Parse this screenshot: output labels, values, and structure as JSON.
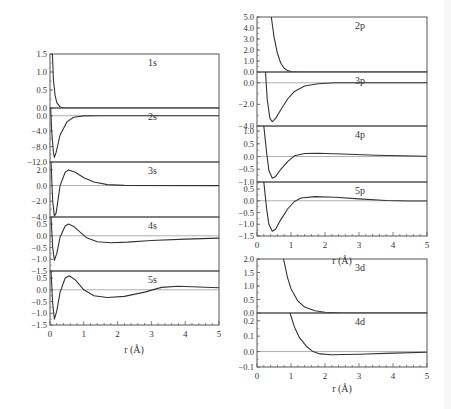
{
  "chart_data": [
    {
      "type": "line",
      "title": "Left stack: s radial functions",
      "xlabel": "r (Å)",
      "xlim": [
        0,
        5
      ],
      "xticks": [
        "0",
        "1",
        "2",
        "3",
        "4",
        "5"
      ],
      "frame": {
        "x0": 50,
        "x1": 219
      },
      "panels": [
        {
          "label": "1s",
          "y0": 54,
          "y1": 108,
          "ylim": [
            0.0,
            1.5
          ],
          "yticks": [
            "1.5",
            "1.0",
            "0.5",
            "0.0"
          ],
          "zero_line": false,
          "curve": [
            [
              0.07,
              1.5
            ],
            [
              0.1,
              0.8
            ],
            [
              0.15,
              0.35
            ],
            [
              0.2,
              0.15
            ],
            [
              0.3,
              0.03
            ],
            [
              0.4,
              0.0
            ],
            [
              5,
              0.0
            ]
          ]
        },
        {
          "label": "2s",
          "y0": 108,
          "y1": 162,
          "ylim": [
            -12.0,
            2.0
          ],
          "yticks": [
            "0.0",
            "-4.0",
            "-8.0",
            "-12.0"
          ],
          "zero_line": true,
          "curve": [
            [
              0.02,
              2.0
            ],
            [
              0.05,
              -4
            ],
            [
              0.1,
              -9.5
            ],
            [
              0.13,
              -10.8
            ],
            [
              0.18,
              -9.5
            ],
            [
              0.3,
              -5
            ],
            [
              0.5,
              -1.6
            ],
            [
              0.7,
              -0.4
            ],
            [
              1.0,
              -0.05
            ],
            [
              1.5,
              0
            ],
            [
              5,
              0
            ]
          ]
        },
        {
          "label": "3s",
          "y0": 162,
          "y1": 217,
          "ylim": [
            -4.0,
            3.0
          ],
          "yticks": [
            "2.0",
            "0.0",
            "-2.0",
            "-4.0"
          ],
          "zero_line": true,
          "curve": [
            [
              0.03,
              3.0
            ],
            [
              0.08,
              -2
            ],
            [
              0.13,
              -3.9
            ],
            [
              0.18,
              -3.5
            ],
            [
              0.3,
              0
            ],
            [
              0.45,
              1.7
            ],
            [
              0.55,
              2.0
            ],
            [
              0.75,
              1.7
            ],
            [
              1.0,
              1.0
            ],
            [
              1.3,
              0.45
            ],
            [
              1.7,
              0.12
            ],
            [
              2.2,
              0.02
            ],
            [
              5,
              0
            ]
          ]
        },
        {
          "label": "4s",
          "y0": 217,
          "y1": 271,
          "ylim": [
            -1.5,
            0.8
          ],
          "yticks": [
            "0.5",
            "0.0",
            "-0.5",
            "-1.0",
            "-1.5"
          ],
          "zero_line": true,
          "curve": [
            [
              0.03,
              0.8
            ],
            [
              0.08,
              -0.5
            ],
            [
              0.13,
              -1.05
            ],
            [
              0.2,
              -0.75
            ],
            [
              0.3,
              -0.05
            ],
            [
              0.45,
              0.42
            ],
            [
              0.55,
              0.5
            ],
            [
              0.7,
              0.4
            ],
            [
              0.9,
              0.15
            ],
            [
              1.1,
              -0.1
            ],
            [
              1.4,
              -0.25
            ],
            [
              1.8,
              -0.3
            ],
            [
              2.3,
              -0.27
            ],
            [
              3.0,
              -0.2
            ],
            [
              4.0,
              -0.14
            ],
            [
              5.0,
              -0.1
            ]
          ]
        },
        {
          "label": "5s",
          "y0": 271,
          "y1": 325,
          "ylim": [
            -1.5,
            0.8
          ],
          "yticks": [
            "0.5",
            "0.0",
            "-0.5",
            "-1.0",
            "-1.5"
          ],
          "zero_line": true,
          "curve": [
            [
              0.03,
              0.8
            ],
            [
              0.08,
              -0.6
            ],
            [
              0.13,
              -1.25
            ],
            [
              0.2,
              -0.9
            ],
            [
              0.3,
              -0.1
            ],
            [
              0.45,
              0.5
            ],
            [
              0.57,
              0.6
            ],
            [
              0.75,
              0.42
            ],
            [
              1.0,
              0.0
            ],
            [
              1.3,
              -0.25
            ],
            [
              1.7,
              -0.33
            ],
            [
              2.2,
              -0.28
            ],
            [
              2.8,
              -0.1
            ],
            [
              3.3,
              0.1
            ],
            [
              3.8,
              0.15
            ],
            [
              4.4,
              0.12
            ],
            [
              5.0,
              0.09
            ]
          ]
        }
      ]
    },
    {
      "type": "line",
      "title": "Right stacks: p and d radial functions",
      "xlabel": "r (Å)",
      "xlim": [
        0,
        5
      ],
      "xticks": [
        "0",
        "1",
        "2",
        "3",
        "4",
        "5"
      ],
      "frame": {
        "x0": 257,
        "x1": 427
      },
      "groups": [
        {
          "panels": [
            {
              "label": "2p",
              "y0": 17,
              "y1": 72,
              "ylim": [
                0.0,
                5.0
              ],
              "yticks": [
                "5.0",
                "4.0",
                "3.0",
                "2.0",
                "1.0",
                "0.0"
              ],
              "zero_line": false,
              "curve": [
                [
                  0.42,
                  5.0
                ],
                [
                  0.5,
                  3.2
                ],
                [
                  0.6,
                  1.7
                ],
                [
                  0.7,
                  0.8
                ],
                [
                  0.8,
                  0.35
                ],
                [
                  0.9,
                  0.13
                ],
                [
                  1.0,
                  0.04
                ],
                [
                  1.2,
                  0.0
                ],
                [
                  5,
                  0
                ]
              ]
            },
            {
              "label": "3p",
              "y0": 72,
              "y1": 126,
              "ylim": [
                -4.0,
                1.0
              ],
              "yticks": [
                "0.0",
                "-2.0",
                "-4.0"
              ],
              "zero_line": true,
              "curve": [
                [
                  0.25,
                  1.0
                ],
                [
                  0.3,
                  -1.5
                ],
                [
                  0.38,
                  -3.3
                ],
                [
                  0.45,
                  -3.6
                ],
                [
                  0.55,
                  -3.3
                ],
                [
                  0.7,
                  -2.5
                ],
                [
                  0.9,
                  -1.5
                ],
                [
                  1.1,
                  -0.8
                ],
                [
                  1.4,
                  -0.3
                ],
                [
                  1.8,
                  -0.08
                ],
                [
                  2.3,
                  0.0
                ],
                [
                  5,
                  0
                ]
              ]
            },
            {
              "label": "4p",
              "y0": 126,
              "y1": 182,
              "ylim": [
                -1.0,
                1.2
              ],
              "yticks": [
                "1.0",
                "0.5",
                "0.0",
                "-0.5",
                "-1.0"
              ],
              "zero_line": true,
              "curve": [
                [
                  0.2,
                  1.2
                ],
                [
                  0.28,
                  0.2
                ],
                [
                  0.35,
                  -0.55
                ],
                [
                  0.45,
                  -0.85
                ],
                [
                  0.55,
                  -0.78
                ],
                [
                  0.7,
                  -0.5
                ],
                [
                  0.9,
                  -0.2
                ],
                [
                  1.1,
                  0.03
                ],
                [
                  1.4,
                  0.12
                ],
                [
                  1.8,
                  0.13
                ],
                [
                  2.5,
                  0.1
                ],
                [
                  3.5,
                  0.05
                ],
                [
                  5.0,
                  0.01
                ]
              ]
            },
            {
              "label": "5p",
              "y0": 182,
              "y1": 236,
              "ylim": [
                -1.5,
                0.8
              ],
              "yticks": [
                "0.5",
                "0.0",
                "-0.5",
                "-1.0",
                "-1.5"
              ],
              "zero_line": true,
              "curve": [
                [
                  0.2,
                  0.8
                ],
                [
                  0.28,
                  -0.3
                ],
                [
                  0.35,
                  -1.0
                ],
                [
                  0.45,
                  -1.3
                ],
                [
                  0.55,
                  -1.2
                ],
                [
                  0.7,
                  -0.8
                ],
                [
                  0.9,
                  -0.35
                ],
                [
                  1.1,
                  -0.03
                ],
                [
                  1.3,
                  0.12
                ],
                [
                  1.7,
                  0.18
                ],
                [
                  2.3,
                  0.15
                ],
                [
                  3.0,
                  0.08
                ],
                [
                  3.8,
                  0.01
                ],
                [
                  4.5,
                  -0.01
                ],
                [
                  5.0,
                  -0.01
                ]
              ]
            }
          ]
        },
        {
          "panels": [
            {
              "label": "3d",
              "y0": 259,
              "y1": 313,
              "ylim": [
                0.0,
                2.0
              ],
              "yticks": [
                "2.0",
                "1.5",
                "1.0",
                "0.5",
                "0.0"
              ],
              "zero_line": false,
              "curve": [
                [
                  0.78,
                  2.0
                ],
                [
                  0.9,
                  1.3
                ],
                [
                  1.0,
                  0.9
                ],
                [
                  1.2,
                  0.45
                ],
                [
                  1.4,
                  0.22
                ],
                [
                  1.7,
                  0.08
                ],
                [
                  2.0,
                  0.03
                ],
                [
                  2.5,
                  0.0
                ],
                [
                  5,
                  0
                ]
              ]
            },
            {
              "label": "4d",
              "y0": 313,
              "y1": 367,
              "ylim": [
                -0.1,
                0.25
              ],
              "yticks": [
                "0.2",
                "0.1",
                "0.0",
                "-0.1"
              ],
              "zero_line": true,
              "curve": [
                [
                  0.97,
                  0.25
                ],
                [
                  1.1,
                  0.16
                ],
                [
                  1.25,
                  0.09
                ],
                [
                  1.45,
                  0.035
                ],
                [
                  1.65,
                  0.0
                ],
                [
                  1.85,
                  -0.015
                ],
                [
                  2.2,
                  -0.02
                ],
                [
                  3.0,
                  -0.017
                ],
                [
                  4.0,
                  -0.01
                ],
                [
                  5.0,
                  -0.005
                ]
              ]
            }
          ]
        }
      ]
    }
  ],
  "labels": {
    "xlabel_left": "r (Å)",
    "xlabel_right_top": "r (Å)",
    "xlabel_right_bottom": "r (Å)"
  }
}
